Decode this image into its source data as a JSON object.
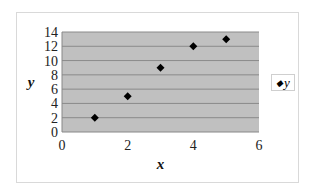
{
  "chart_data": {
    "type": "scatter",
    "title": "",
    "xlabel": "x",
    "ylabel": "y",
    "xlim": [
      0,
      6
    ],
    "ylim": [
      0,
      14
    ],
    "xticks": [
      0,
      2,
      4,
      6
    ],
    "yticks": [
      0,
      2,
      4,
      6,
      8,
      10,
      12,
      14
    ],
    "grid": "horizontal",
    "legend_position": "right",
    "series": [
      {
        "name": "y",
        "marker": "diamond",
        "color": "#000000",
        "x": [
          1,
          2,
          3,
          4,
          5
        ],
        "y": [
          2,
          5,
          9,
          12,
          13
        ]
      }
    ],
    "colors": {
      "plot_bg": "#c0c0c0",
      "gridline": "#8a8a8a"
    }
  },
  "legend": {
    "label": "y",
    "marker": "◆"
  }
}
